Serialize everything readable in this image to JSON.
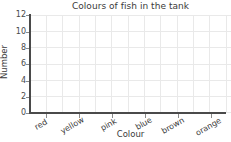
{
  "chart_data": {
    "type": "bar",
    "title": "Colours of fish in the tank",
    "xlabel": "Colour",
    "ylabel": "Number",
    "categories": [
      "red",
      "yellow",
      "pink",
      "blue",
      "brown",
      "orange"
    ],
    "values": [
      0,
      0,
      0,
      0,
      0,
      0
    ],
    "series": [
      {
        "name": "Number",
        "values": [
          0,
          0,
          0,
          0,
          0,
          0
        ]
      }
    ],
    "ylim": [
      0,
      12
    ],
    "ytick_labels": [
      "0",
      "2",
      "4",
      "6",
      "8",
      "10",
      "12"
    ],
    "ytick_values": [
      0,
      2,
      4,
      6,
      8,
      10,
      12
    ],
    "grid": true,
    "legend": "none",
    "note": "Empty axes template — no bars plotted"
  },
  "colors": {
    "background": "#ffffff",
    "axis": "#4a4a4a",
    "gridline": "#e9e9e9",
    "text": "#3a3a3a",
    "tick": "#8a8a8a"
  }
}
